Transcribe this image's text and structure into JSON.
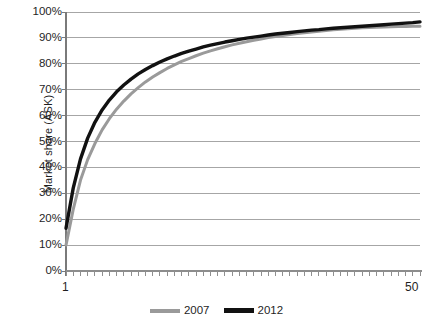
{
  "chart_data": {
    "type": "line",
    "title": "",
    "subtitle": "",
    "xlabel": "",
    "ylabel": "Market share (ASK)",
    "ylim": [
      0,
      1
    ],
    "xlim": [
      1,
      50
    ],
    "grid": "horizontal",
    "legend_position": "bottom",
    "y_tick_labels": [
      "100%",
      "90%",
      "80%",
      "70%",
      "60%",
      "50%",
      "40%",
      "30%",
      "20%",
      "10%",
      "0%"
    ],
    "y_tick_values": [
      1.0,
      0.9,
      0.8,
      0.7,
      0.6,
      0.5,
      0.4,
      0.3,
      0.2,
      0.1,
      0.0
    ],
    "x_tick_labels": [
      "1",
      "50"
    ],
    "x_tick_count": 50,
    "x": [
      1,
      2,
      3,
      4,
      5,
      6,
      7,
      8,
      9,
      10,
      11,
      12,
      13,
      14,
      15,
      16,
      17,
      18,
      19,
      20,
      21,
      22,
      23,
      24,
      25,
      26,
      27,
      28,
      29,
      30,
      31,
      32,
      33,
      34,
      35,
      36,
      37,
      38,
      39,
      40,
      41,
      42,
      43,
      44,
      45,
      46,
      47,
      48,
      49,
      50
    ],
    "series": [
      {
        "name": "2007",
        "color": "#9a9a9a",
        "line_width": 3,
        "values": [
          0.1,
          0.238,
          0.35,
          0.43,
          0.492,
          0.545,
          0.588,
          0.625,
          0.656,
          0.684,
          0.708,
          0.73,
          0.749,
          0.766,
          0.782,
          0.796,
          0.809,
          0.82,
          0.831,
          0.841,
          0.85,
          0.858,
          0.866,
          0.873,
          0.879,
          0.885,
          0.891,
          0.896,
          0.901,
          0.905,
          0.909,
          0.913,
          0.917,
          0.92,
          0.923,
          0.926,
          0.929,
          0.931,
          0.933,
          0.935,
          0.937,
          0.939,
          0.94,
          0.941,
          0.942,
          0.943,
          0.944,
          0.944,
          0.945,
          0.945
        ]
      },
      {
        "name": "2012",
        "color": "#111111",
        "line_width": 3.4,
        "values": [
          0.165,
          0.32,
          0.432,
          0.513,
          0.574,
          0.622,
          0.66,
          0.692,
          0.718,
          0.741,
          0.761,
          0.778,
          0.793,
          0.807,
          0.819,
          0.83,
          0.84,
          0.849,
          0.857,
          0.865,
          0.872,
          0.878,
          0.884,
          0.889,
          0.894,
          0.899,
          0.903,
          0.907,
          0.911,
          0.915,
          0.918,
          0.921,
          0.924,
          0.927,
          0.93,
          0.932,
          0.935,
          0.937,
          0.939,
          0.941,
          0.943,
          0.945,
          0.947,
          0.949,
          0.951,
          0.953,
          0.955,
          0.957,
          0.959,
          0.962
        ]
      }
    ]
  },
  "legend": {
    "items": [
      {
        "label": "2007",
        "color": "#9a9a9a"
      },
      {
        "label": "2012",
        "color": "#111111"
      }
    ]
  },
  "axes": {
    "y_title": "Market share (ASK)",
    "x_start_label": "1",
    "x_end_label": "50"
  }
}
